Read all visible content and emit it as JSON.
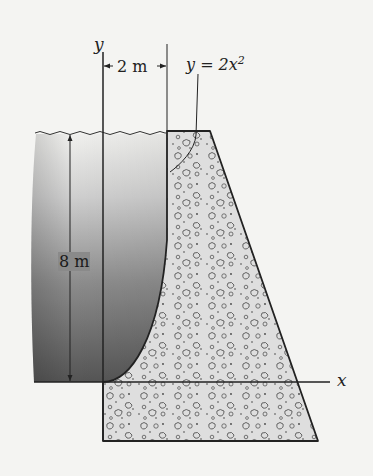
{
  "figure": {
    "type": "dam cross-section with parabolic water face",
    "axes": {
      "x_label": "x",
      "y_label": "y"
    },
    "dimensions": {
      "horizontal": "2 m",
      "vertical": "8 m"
    },
    "curve_equation": {
      "lhs": "y = 2x",
      "exponent": "2"
    },
    "regions": {
      "water": "shaded water region left of dam",
      "dam": "concrete dam with aggregate texture"
    },
    "colors": {
      "background": "#f4f4f2",
      "water_dark": "#4a4a4a",
      "water_light": "#c8c8c8",
      "concrete": "#dcdcdc",
      "outline": "#222222"
    }
  }
}
